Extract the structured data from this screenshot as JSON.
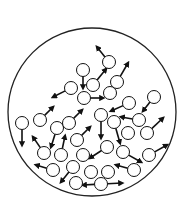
{
  "diagram": {
    "container": {
      "cx": 92,
      "cy": 112,
      "r": 84,
      "stroke": "#222222"
    },
    "particle_radius": 6.5,
    "stroke_color": "#111111",
    "particles": [
      {
        "x": 109,
        "y": 62,
        "ax": 97,
        "ay": 47
      },
      {
        "x": 83,
        "y": 70,
        "ax": 83,
        "ay": 88
      },
      {
        "x": 93,
        "y": 85,
        "ax": 106,
        "ay": 69
      },
      {
        "x": 117,
        "y": 82,
        "ax": 128,
        "ay": 63
      },
      {
        "x": 71,
        "y": 88,
        "ax": 53,
        "ay": 97
      },
      {
        "x": 110,
        "y": 93,
        "ax": null,
        "ay": null
      },
      {
        "x": 84,
        "y": 98,
        "ax": 103,
        "ay": 98
      },
      {
        "x": 154,
        "y": 97,
        "ax": 143,
        "ay": 111
      },
      {
        "x": 129,
        "y": 103,
        "ax": 111,
        "ay": 111
      },
      {
        "x": 22,
        "y": 123,
        "ax": 22,
        "ay": 145
      },
      {
        "x": 40,
        "y": 120,
        "ax": 53,
        "ay": 107
      },
      {
        "x": 57,
        "y": 128,
        "ax": 51,
        "ay": 147
      },
      {
        "x": 69,
        "y": 123,
        "ax": 82,
        "ay": 110
      },
      {
        "x": 101,
        "y": 115,
        "ax": 101,
        "ay": 138
      },
      {
        "x": 114,
        "y": 122,
        "ax": 120,
        "ay": 143
      },
      {
        "x": 139,
        "y": 120,
        "ax": 121,
        "ay": 117
      },
      {
        "x": 128,
        "y": 133,
        "ax": null,
        "ay": null
      },
      {
        "x": 147,
        "y": 133,
        "ax": 163,
        "ay": 118
      },
      {
        "x": 77,
        "y": 140,
        "ax": 90,
        "ay": 127
      },
      {
        "x": 44,
        "y": 153,
        "ax": 33,
        "ay": 137
      },
      {
        "x": 61,
        "y": 155,
        "ax": 65,
        "ay": 136
      },
      {
        "x": 83,
        "y": 155,
        "ax": null,
        "ay": null
      },
      {
        "x": 107,
        "y": 147,
        "ax": 90,
        "ay": 158
      },
      {
        "x": 123,
        "y": 152,
        "ax": 141,
        "ay": 162
      },
      {
        "x": 149,
        "y": 155,
        "ax": 167,
        "ay": 145
      },
      {
        "x": 73,
        "y": 167,
        "ax": 61,
        "ay": 182
      },
      {
        "x": 53,
        "y": 170,
        "ax": 36,
        "ay": 165
      },
      {
        "x": 91,
        "y": 172,
        "ax": null,
        "ay": null
      },
      {
        "x": 108,
        "y": 172,
        "ax": null,
        "ay": null
      },
      {
        "x": 134,
        "y": 170,
        "ax": 116,
        "ay": 165
      },
      {
        "x": 76,
        "y": 183,
        "ax": null,
        "ay": null
      },
      {
        "x": 101,
        "y": 184,
        "ax": 83,
        "ay": 185
      },
      {
        "x": 101,
        "y": 184,
        "ax": 122,
        "ay": 183
      }
    ]
  }
}
